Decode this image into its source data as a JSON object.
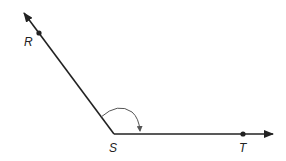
{
  "diagram": {
    "type": "angle",
    "points": {
      "R": {
        "label": "R",
        "x": 39,
        "y": 33
      },
      "S": {
        "label": "S",
        "x": 114,
        "y": 134
      },
      "T": {
        "label": "T",
        "x": 243,
        "y": 134
      }
    },
    "rays": [
      {
        "name": "ray-SR",
        "from": "S",
        "through": "R",
        "tip": {
          "x": 24,
          "y": 13
        }
      },
      {
        "name": "ray-ST",
        "from": "S",
        "through": "T",
        "tip": {
          "x": 273,
          "y": 134
        }
      }
    ],
    "angle_marker": {
      "vertex": "S",
      "from": "R",
      "to": "T",
      "style": "arc-with-arrow"
    },
    "colors": {
      "line": "#222222",
      "arc": "#555555",
      "background": "#ffffff"
    }
  }
}
